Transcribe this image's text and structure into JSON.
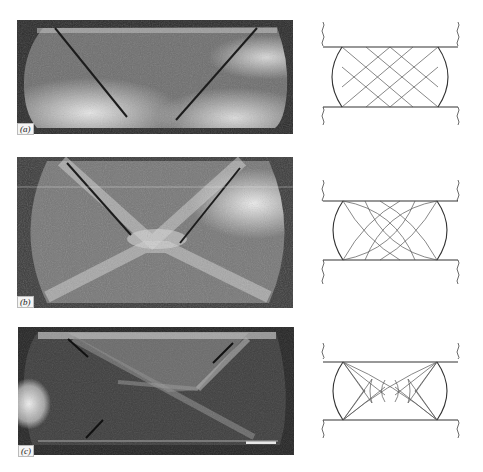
{
  "figure": {
    "panels": [
      {
        "id": "a",
        "label": "(a)",
        "description": "Fractured compression specimen photo with two inclined shear cracks",
        "diagram": "Straight crossing slip-line grid between platens"
      },
      {
        "id": "b",
        "label": "(b)",
        "description": "Barrel-shaped compression specimen photo with X-shaped shear bands",
        "diagram": "Curved slip-line field between platens"
      },
      {
        "id": "c",
        "label": "(c)",
        "description": "Compression specimen photo with diagonal shear cracks and dead-metal zones",
        "diagram": "Fan-shaped slip-lines emanating from specimen corners"
      }
    ]
  },
  "colors": {
    "background": "#ffffff",
    "photo_dark": "#2a2a2a",
    "photo_light": "#e8e8e8",
    "line": "#333333"
  }
}
